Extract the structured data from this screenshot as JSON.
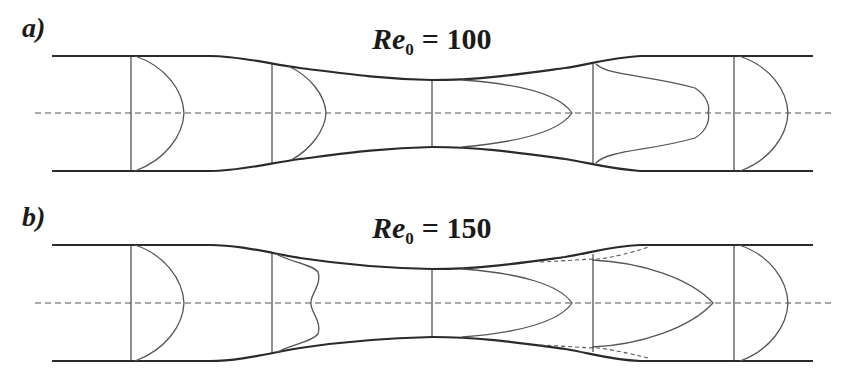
{
  "figure": {
    "panels": [
      {
        "id": "a",
        "label": "a)",
        "title_re": "Re",
        "title_sub": "0",
        "title_rest": "= 100",
        "reynolds_number": 100,
        "profile_shapes": [
          "parabolic",
          "parabolic",
          "elongated-parabolic",
          "flattened-jet",
          "parabolic"
        ],
        "separation_zone": false
      },
      {
        "id": "b",
        "label": "b)",
        "title_re": "Re",
        "title_sub": "0",
        "title_rest": "= 150",
        "reynolds_number": 150,
        "profile_shapes": [
          "parabolic",
          "inflected-double-peak",
          "elongated-parabolic",
          "jet-with-separation",
          "parabolic"
        ],
        "separation_zone": true
      }
    ],
    "stations_x": [
      131,
      272,
      432,
      593,
      734
    ],
    "colors": {
      "wall": "#2a2a2a",
      "profile": "#555555",
      "background": "#ffffff"
    }
  }
}
